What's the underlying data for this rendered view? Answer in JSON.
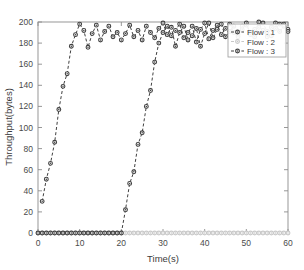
{
  "figure": {
    "background_color": "#ffffff",
    "frame_color": "#8c8c8c"
  },
  "chart_data": {
    "type": "line",
    "title": "",
    "xlabel": "Time(s)",
    "ylabel": "Throughput(bytes)",
    "xlim": [
      0,
      60
    ],
    "ylim": [
      0,
      200
    ],
    "xticks": [
      0,
      10,
      20,
      30,
      40,
      50,
      60
    ],
    "yticks": [
      0,
      20,
      40,
      60,
      80,
      100,
      120,
      140,
      160,
      180,
      200
    ],
    "grid": false,
    "legend_position": "upper right",
    "marker": "circle",
    "linestyle": "dashed",
    "series": [
      {
        "name": "Flow : 1",
        "color": "#404040",
        "x": [
          1,
          2,
          3,
          4,
          5,
          6,
          7,
          8,
          9,
          10,
          11,
          12,
          13,
          14,
          15,
          16,
          17,
          18,
          19,
          20,
          21,
          22,
          23,
          24,
          25,
          26,
          27,
          28,
          29,
          30,
          31,
          32,
          33,
          34,
          35,
          36,
          37,
          38,
          39,
          40,
          41,
          42,
          43,
          44,
          45,
          46,
          47,
          48,
          49,
          50,
          51,
          52,
          53,
          54,
          55,
          56,
          57,
          58,
          59,
          60
        ],
        "values": [
          30,
          51,
          66,
          86,
          117,
          139,
          151,
          177,
          188,
          198,
          192,
          176,
          189,
          197,
          183,
          191,
          196,
          186,
          190,
          183,
          189,
          197,
          186,
          192,
          183,
          196,
          190,
          185,
          194,
          199,
          188,
          195,
          177,
          190,
          196,
          183,
          187,
          194,
          177,
          189,
          199,
          185,
          193,
          198,
          186,
          191,
          196,
          188,
          193,
          197,
          190,
          186,
          195,
          199,
          191,
          187,
          194,
          198,
          198,
          193
        ]
      },
      {
        "name": "Flow : 2",
        "color": "#c8c8c8",
        "x": [
          0,
          1,
          2,
          3,
          4,
          5,
          6,
          7,
          8,
          9,
          10,
          11,
          12,
          13,
          14,
          15,
          16,
          17,
          18,
          19,
          20,
          21,
          22,
          23,
          24,
          25,
          26,
          27,
          28,
          29,
          30,
          31,
          32,
          33,
          34,
          35,
          36,
          37,
          38,
          39,
          40,
          41,
          42,
          43,
          44,
          45,
          46,
          47,
          48,
          49,
          50,
          51,
          52,
          53,
          54,
          55,
          56,
          57,
          58,
          59,
          60
        ],
        "values": [
          0,
          0,
          0,
          0,
          0,
          0,
          0,
          0,
          0,
          0,
          0,
          0,
          0,
          0,
          0,
          0,
          0,
          0,
          0,
          0,
          0,
          0,
          0,
          0,
          0,
          0,
          0,
          0,
          0,
          0,
          0,
          0,
          0,
          0,
          0,
          0,
          0,
          0,
          0,
          0,
          0,
          0,
          0,
          0,
          0,
          0,
          0,
          0,
          0,
          0,
          0,
          0,
          0,
          0,
          0,
          0,
          0,
          0,
          0,
          0,
          0
        ]
      },
      {
        "name": "Flow : 3",
        "color": "#404040",
        "x": [
          0,
          1,
          2,
          3,
          4,
          5,
          6,
          7,
          8,
          9,
          10,
          11,
          12,
          13,
          14,
          15,
          16,
          17,
          18,
          19,
          20,
          21,
          22,
          23,
          24,
          25,
          26,
          27,
          28,
          29,
          30,
          31,
          32,
          33,
          34,
          35,
          36,
          37,
          38,
          39,
          40,
          41,
          42,
          43,
          44,
          45,
          46,
          47,
          48,
          49,
          50,
          51,
          52,
          53,
          54,
          55,
          56,
          57,
          58,
          59,
          60
        ],
        "values": [
          0,
          0,
          0,
          0,
          0,
          0,
          0,
          0,
          0,
          0,
          0,
          0,
          0,
          0,
          0,
          0,
          0,
          0,
          0,
          0,
          0,
          22,
          47,
          58,
          84,
          95,
          120,
          135,
          162,
          180,
          190,
          196,
          187,
          192,
          198,
          185,
          190,
          196,
          181,
          193,
          199,
          184,
          192,
          197,
          188,
          194,
          198,
          190,
          186,
          196,
          199,
          188,
          193,
          200,
          192,
          186,
          195,
          199,
          191,
          196,
          191
        ]
      }
    ]
  },
  "axes": {
    "x_tick_labels": [
      "0",
      "10",
      "20",
      "30",
      "40",
      "50",
      "60"
    ],
    "y_tick_labels": [
      "0",
      "20",
      "40",
      "60",
      "80",
      "100",
      "120",
      "140",
      "160",
      "180",
      "200"
    ],
    "x_axis_title": "Time(s)",
    "y_axis_title": "Throughput(bytes)"
  },
  "legend": {
    "entries": [
      {
        "label": "Flow : 1",
        "color": "#404040",
        "marker": "circle-filled",
        "linestyle": "dashed"
      },
      {
        "label": "Flow : 2",
        "color": "#c8c8c8",
        "marker": "circle-filled",
        "linestyle": "dashed"
      },
      {
        "label": "Flow : 3",
        "color": "#404040",
        "marker": "circle-filled",
        "linestyle": "dashed"
      }
    ]
  }
}
